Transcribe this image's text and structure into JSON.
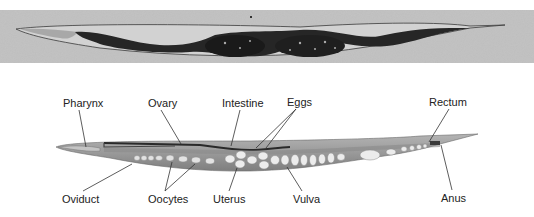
{
  "figure": {
    "photo_alt": "Micrograph of C. elegans hermaphrodite",
    "top_labels": [
      {
        "text": "Pharynx",
        "x": 63,
        "y": 97
      },
      {
        "text": "Ovary",
        "x": 148,
        "y": 97
      },
      {
        "text": "Intestine",
        "x": 222,
        "y": 97
      },
      {
        "text": "Eggs",
        "x": 287,
        "y": 96
      },
      {
        "text": "Rectum",
        "x": 429,
        "y": 96
      }
    ],
    "bottom_labels": [
      {
        "text": "Oviduct",
        "x": 62,
        "y": 193
      },
      {
        "text": "Oocytes",
        "x": 148,
        "y": 193
      },
      {
        "text": "Uterus",
        "x": 213,
        "y": 193
      },
      {
        "text": "Vulva",
        "x": 293,
        "y": 193
      },
      {
        "text": "Anus",
        "x": 441,
        "y": 192
      }
    ]
  },
  "colors": {
    "photo_bg": "#bdbdbd",
    "worm_dark": "#1e1e1e",
    "diagram_body": "#9a9a9a",
    "egg_fill": "#e6e6e6",
    "line": "#333333"
  }
}
